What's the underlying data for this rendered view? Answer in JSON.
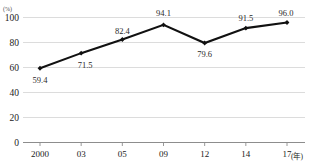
{
  "chart_data": {
    "type": "line",
    "title": "",
    "xlabel": "",
    "ylabel": "",
    "y_unit_label": "(%)",
    "x_unit_label": "(年)",
    "categories": [
      "2000",
      "03",
      "05",
      "09",
      "12",
      "14",
      "17"
    ],
    "values": [
      59.4,
      71.5,
      82.4,
      94.1,
      79.6,
      91.5,
      96.0
    ],
    "point_labels": [
      "59.4",
      "71.5",
      "82.4",
      "94.1",
      "79.6",
      "91.5",
      "96.0"
    ],
    "ylim": [
      0,
      100
    ],
    "yticks": [
      0,
      20,
      40,
      60,
      80,
      100
    ],
    "ytick_labels": [
      "0",
      "20",
      "40",
      "60",
      "80",
      "100"
    ],
    "grid": true,
    "legend": "none",
    "series": [
      {
        "name": "",
        "values": [
          59.4,
          71.5,
          82.4,
          94.1,
          79.6,
          91.5,
          96.0
        ],
        "color": "#111111",
        "marker": "diamond"
      }
    ],
    "colors": {
      "line": "#111111",
      "marker": "#111111",
      "gridline": "#d8d8d8",
      "baseline": "#8d8d8d",
      "text": "#1a1a1a",
      "background": "#ffffff"
    }
  }
}
